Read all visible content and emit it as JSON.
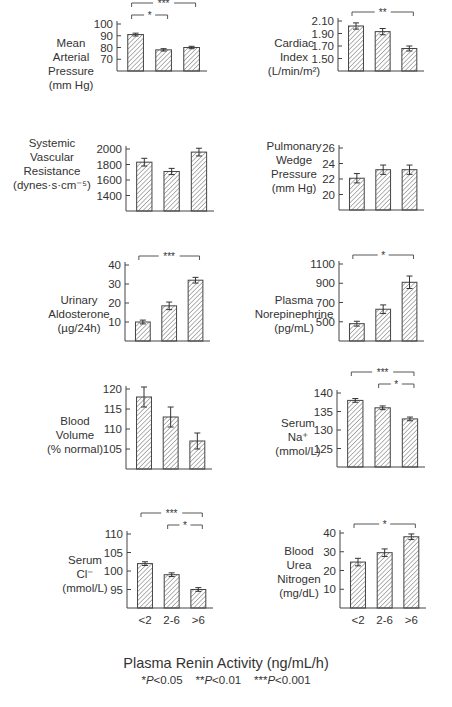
{
  "figure": {
    "xlabel": "Plasma Renin Activity (ng/mL/h)",
    "significance_legend": "*P<0.05   **P<0.01   ***P<0.001",
    "categories": [
      "<2",
      "2-6",
      ">6"
    ]
  },
  "chart_data": [
    {
      "type": "bar",
      "title": "Mean Arterial Pressure",
      "ylabel": "Mean\nArterial\nPressure\n(mm Hg)",
      "categories": [
        "<2",
        "2-6",
        ">6"
      ],
      "values": [
        91,
        78,
        80
      ],
      "errors": [
        1.2,
        1.0,
        1.0
      ],
      "yticks": [
        70,
        80,
        90,
        100
      ],
      "ylim": [
        60,
        100
      ],
      "significance": [
        {
          "from": 0,
          "to": 2,
          "label": "***"
        },
        {
          "from": 0,
          "to": 1,
          "label": "*"
        }
      ]
    },
    {
      "type": "bar",
      "title": "Cardiac Index",
      "ylabel": "Cardiac\nIndex\n(L/min/m²)",
      "categories": [
        "<2",
        "2-6",
        ">6"
      ],
      "values": [
        2.02,
        1.93,
        1.66
      ],
      "errors": [
        0.05,
        0.05,
        0.04
      ],
      "yticks": [
        1.5,
        1.7,
        1.9,
        2.1
      ],
      "ytick_labels": [
        "1.50",
        "1.70",
        "1.90",
        "2.10"
      ],
      "ylim": [
        1.3,
        2.1
      ],
      "significance": [
        {
          "from": 0,
          "to": 2,
          "label": "**"
        }
      ]
    },
    {
      "type": "bar",
      "title": "Systemic Vascular Resistance",
      "ylabel": "Systemic\nVascular\nResistance\n(dynes·s·cm⁻⁵)",
      "categories": [
        "<2",
        "2-6",
        ">6"
      ],
      "values": [
        1830,
        1710,
        1960
      ],
      "errors": [
        50,
        40,
        50
      ],
      "yticks": [
        1400,
        1600,
        1800,
        2000
      ],
      "ylim": [
        1200,
        2000
      ],
      "significance": []
    },
    {
      "type": "bar",
      "title": "Pulmonary Wedge Pressure",
      "ylabel": "Pulmonary\nWedge\nPressure\n(mm Hg)",
      "categories": [
        "<2",
        "2-6",
        ">6"
      ],
      "values": [
        22.1,
        23.2,
        23.2
      ],
      "errors": [
        0.6,
        0.6,
        0.6
      ],
      "yticks": [
        20,
        22,
        24,
        26
      ],
      "ylim": [
        18,
        26
      ],
      "significance": []
    },
    {
      "type": "bar",
      "title": "Urinary Aldosterone",
      "ylabel": "Urinary\nAldosterone\n(µg/24h)",
      "categories": [
        "<2",
        "2-6",
        ">6"
      ],
      "values": [
        10,
        18.5,
        32
      ],
      "errors": [
        1,
        2,
        1.5
      ],
      "yticks": [
        10,
        20,
        30,
        40
      ],
      "ylim": [
        0,
        40
      ],
      "significance": [
        {
          "from": 0,
          "to": 2,
          "label": "***"
        }
      ]
    },
    {
      "type": "bar",
      "title": "Plasma Norepinephrine",
      "ylabel": "Plasma\nNorepinephrine\n(pg/mL)",
      "categories": [
        "<2",
        "2-6",
        ">6"
      ],
      "values": [
        480,
        630,
        910
      ],
      "errors": [
        25,
        45,
        65
      ],
      "yticks": [
        500,
        700,
        900,
        1100
      ],
      "ylim": [
        300,
        1100
      ],
      "significance": [
        {
          "from": 0,
          "to": 2,
          "label": "*"
        }
      ]
    },
    {
      "type": "bar",
      "title": "Blood Volume",
      "ylabel": "Blood\nVolume\n(% normal)",
      "categories": [
        "<2",
        "2-6",
        ">6"
      ],
      "values": [
        118,
        113,
        107
      ],
      "errors": [
        2.5,
        2.5,
        2
      ],
      "yticks": [
        105,
        110,
        115,
        120
      ],
      "ylim": [
        100,
        120
      ],
      "significance": []
    },
    {
      "type": "bar",
      "title": "Serum Na+",
      "ylabel": "Serum\nNa⁺\n(mmol/L)",
      "categories": [
        "<2",
        "2-6",
        ">6"
      ],
      "values": [
        138,
        136,
        133
      ],
      "errors": [
        0.5,
        0.5,
        0.5
      ],
      "yticks": [
        125,
        130,
        135,
        140
      ],
      "ylim": [
        120,
        140
      ],
      "significance": [
        {
          "from": 0,
          "to": 2,
          "label": "***"
        },
        {
          "from": 1,
          "to": 2,
          "label": "*"
        }
      ]
    },
    {
      "type": "bar",
      "title": "Serum Cl-",
      "ylabel": "Serum\nCl⁻\n(mmol/L)",
      "categories": [
        "<2",
        "2-6",
        ">6"
      ],
      "values": [
        102,
        99,
        95
      ],
      "errors": [
        0.5,
        0.5,
        0.5
      ],
      "yticks": [
        95,
        100,
        105,
        110
      ],
      "ylim": [
        90,
        110
      ],
      "significance": [
        {
          "from": 0,
          "to": 2,
          "label": "***"
        },
        {
          "from": 1,
          "to": 2,
          "label": "*"
        }
      ]
    },
    {
      "type": "bar",
      "title": "Blood Urea Nitrogen",
      "ylabel": "Blood\nUrea\nNitrogen\n(mg/dL)",
      "categories": [
        "<2",
        "2-6",
        ">6"
      ],
      "values": [
        24.5,
        29.5,
        38
      ],
      "errors": [
        2,
        2,
        1.5
      ],
      "yticks": [
        10,
        20,
        30,
        40
      ],
      "ylim": [
        0,
        40
      ],
      "significance": [
        {
          "from": 0,
          "to": 2,
          "label": "*"
        }
      ]
    }
  ]
}
